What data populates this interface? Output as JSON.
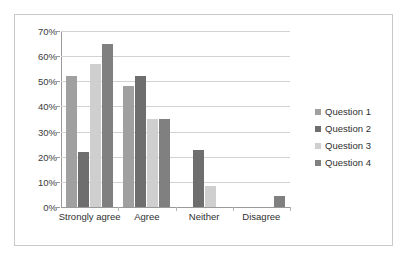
{
  "chart_data": {
    "type": "bar",
    "title": "",
    "subtitle": "",
    "xlabel": "",
    "ylabel": "",
    "categories": [
      "Strongly agree",
      "Agree",
      "Neither",
      "Disagree"
    ],
    "series": [
      {
        "name": "Question 1",
        "color": "#a0a0a0",
        "values": [
          52,
          48,
          0,
          0
        ]
      },
      {
        "name": "Question 2",
        "color": "#6e6e6e",
        "values": [
          22,
          52,
          22.5,
          0
        ]
      },
      {
        "name": "Question 3",
        "color": "#cfcfcf",
        "values": [
          57,
          35,
          8.5,
          0
        ]
      },
      {
        "name": "Question 4",
        "color": "#808080",
        "values": [
          65,
          35,
          0,
          4.5
        ]
      }
    ],
    "ylim": [
      0,
      70
    ],
    "ytick_step": 10,
    "ytick_labels": [
      "0%",
      "10%",
      "20%",
      "30%",
      "40%",
      "50%",
      "60%",
      "70%"
    ],
    "ytick_values": [
      0,
      10,
      20,
      30,
      40,
      50,
      60,
      70
    ],
    "grid": true,
    "grid_axis": "y",
    "legend_position": "right",
    "legend_entries": [
      "Question 1",
      "Question 2",
      "Question 3",
      "Question 4"
    ],
    "annotations": [],
    "value_labels_shown": false,
    "plot_border": "outer frame only",
    "units": "percent"
  }
}
